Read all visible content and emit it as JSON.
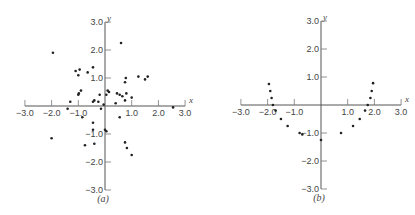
{
  "chart_data": [
    {
      "type": "scatter",
      "title": "",
      "caption": "(a)",
      "xlabel": "x",
      "ylabel": "y",
      "xlim": [
        -3.0,
        3.0
      ],
      "ylim": [
        -3.0,
        3.0
      ],
      "x_ticks": [
        "-3.0",
        "-2.0",
        "-1.0",
        "1.0",
        "2.0",
        "3.0"
      ],
      "y_ticks": [
        "3.0",
        "2.0",
        "1.0",
        "-1.0",
        "-2.0",
        "-3.0"
      ],
      "grid": false,
      "points": [
        [
          -1.95,
          1.9
        ],
        [
          -2.0,
          -1.15
        ],
        [
          -1.1,
          1.25
        ],
        [
          -1.0,
          1.1
        ],
        [
          -0.95,
          1.3
        ],
        [
          -0.65,
          1.2
        ],
        [
          -0.45,
          1.38
        ],
        [
          -1.0,
          0.4
        ],
        [
          -0.98,
          0.45
        ],
        [
          -0.9,
          0.55
        ],
        [
          -1.3,
          0.15
        ],
        [
          -1.4,
          -0.1
        ],
        [
          -0.85,
          -0.4
        ],
        [
          -0.45,
          0.15
        ],
        [
          -0.4,
          0.2
        ],
        [
          -0.2,
          0.4
        ],
        [
          -0.25,
          0.15
        ],
        [
          -0.15,
          -0.1
        ],
        [
          -0.05,
          0.05
        ],
        [
          0.05,
          0.4
        ],
        [
          0.1,
          0.55
        ],
        [
          0.15,
          0.5
        ],
        [
          -0.45,
          -0.6
        ],
        [
          -0.45,
          -0.85
        ],
        [
          -0.4,
          -1.35
        ],
        [
          -0.75,
          -1.4
        ],
        [
          0.0,
          -0.85
        ],
        [
          0.05,
          -0.9
        ],
        [
          0.45,
          0.45
        ],
        [
          0.55,
          0.4
        ],
        [
          0.65,
          0.35
        ],
        [
          0.8,
          0.45
        ],
        [
          0.75,
          0.2
        ],
        [
          0.4,
          0.1
        ],
        [
          0.55,
          -0.4
        ],
        [
          1.0,
          0.3
        ],
        [
          0.75,
          0.85
        ],
        [
          0.78,
          1.0
        ],
        [
          0.6,
          2.25
        ],
        [
          1.25,
          1.05
        ],
        [
          1.5,
          0.95
        ],
        [
          1.6,
          1.05
        ],
        [
          0.75,
          -1.3
        ],
        [
          0.82,
          -1.5
        ],
        [
          1.0,
          -1.75
        ],
        [
          2.55,
          -0.05
        ]
      ]
    },
    {
      "type": "scatter",
      "title": "",
      "caption": "(b)",
      "xlabel": "x",
      "ylabel": "y",
      "xlim": [
        -3.0,
        3.0
      ],
      "ylim": [
        -3.0,
        3.0
      ],
      "x_ticks": [
        "-3.0",
        "-2.0",
        "-1.0",
        "1.0",
        "2.0",
        "3.0"
      ],
      "y_ticks": [
        "3.0",
        "2.0",
        "1.0",
        "-1.0",
        "-2.0",
        "-3.0"
      ],
      "grid": false,
      "points": [
        [
          -1.95,
          0.75
        ],
        [
          -1.9,
          0.5
        ],
        [
          -1.85,
          0.25
        ],
        [
          -1.8,
          0.0
        ],
        [
          -1.7,
          -0.2
        ],
        [
          -1.5,
          -0.5
        ],
        [
          -1.25,
          -0.75
        ],
        [
          -0.8,
          -1.0
        ],
        [
          -0.7,
          -1.05
        ],
        [
          0.0,
          -1.25
        ],
        [
          0.75,
          -1.0
        ],
        [
          1.2,
          -0.75
        ],
        [
          1.45,
          -0.5
        ],
        [
          1.65,
          -0.2
        ],
        [
          1.75,
          0.0
        ],
        [
          1.85,
          0.25
        ],
        [
          1.9,
          0.5
        ],
        [
          1.95,
          0.78
        ]
      ]
    }
  ]
}
